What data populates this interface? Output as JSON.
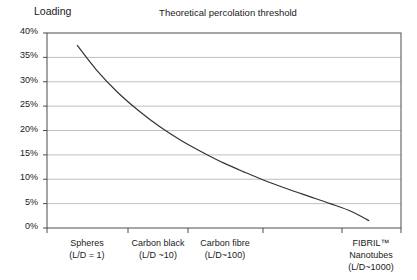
{
  "chart_data": {
    "type": "line",
    "title": "Theoretical percolation threshold",
    "ylabel": "Loading",
    "xlabel": "",
    "ylim": [
      0,
      40
    ],
    "y_unit": "%",
    "grid": true,
    "legend": "none",
    "y_ticks": [
      "40%",
      "35%",
      "30%",
      "25%",
      "20%",
      "15%",
      "10%",
      "5%",
      "0%"
    ],
    "y_tick_values": [
      40,
      35,
      30,
      25,
      20,
      15,
      10,
      5,
      0
    ],
    "categories": [
      {
        "line1": "Spheres",
        "line2": "(L/D = 1)",
        "line3": "",
        "aspect_ratio": 1
      },
      {
        "line1": "Carbon black",
        "line2": "(L/D ~10)",
        "line3": "",
        "aspect_ratio": 10
      },
      {
        "line1": "Carbon fibre",
        "line2": "(L/D~100)",
        "line3": "",
        "aspect_ratio": 100
      },
      {
        "line1": "FIBRIL™",
        "line2": "Nanotubes",
        "line3": "(L/D~1000)",
        "aspect_ratio": 1000
      }
    ],
    "series": [
      {
        "name": "Percolation threshold",
        "color": "#333333",
        "x": [
          0.085,
          0.14,
          0.2,
          0.26,
          0.32,
          0.38,
          0.44,
          0.5,
          0.56,
          0.62,
          0.68,
          0.74,
          0.8,
          0.86,
          0.91
        ],
        "values": [
          37.5,
          32.4,
          27.8,
          24.0,
          20.7,
          17.9,
          15.5,
          13.3,
          11.4,
          9.6,
          8.0,
          6.5,
          5.0,
          3.4,
          1.5
        ]
      }
    ],
    "annotations": []
  },
  "colors": {
    "axis": "#4d4d4d",
    "grid": "#bfbfbf",
    "curve": "#333333",
    "text": "#1a1a1a",
    "background": "#ffffff"
  },
  "geometry": {
    "plot_left": 47,
    "plot_right": 401,
    "plot_top": 33,
    "plot_bottom": 228,
    "x_tick_positions": [
      47,
      128,
      188,
      263,
      342,
      401
    ]
  }
}
